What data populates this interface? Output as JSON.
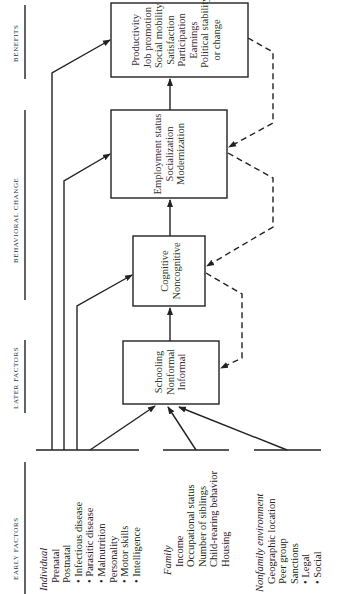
{
  "orientation": "rotated-90-ccw",
  "columns": {
    "early": "EARLY FACTORS",
    "later": "LATER FACTORS",
    "behavioral": "BEHAVIORAL CHANGE",
    "benefits": "BENEFITS"
  },
  "boxes": {
    "schooling": [
      "Schooling",
      "Nonformal",
      "Informal"
    ],
    "cognitive": [
      "Cognitive",
      "Noncognitive"
    ],
    "employment": [
      "Employment status",
      "Socialization",
      "Modernization"
    ],
    "benefits": [
      "Productivity",
      "Job promotion",
      "Social mobility",
      "Satisfaction",
      "Participation",
      "Earnings",
      "Political stability",
      "or change"
    ]
  },
  "early_factors": {
    "individual": {
      "title": "Individual",
      "items": [
        "Prenatal",
        "Postnatal",
        "• Infectious disease",
        "• Parasitic disease",
        "• Malnutrition",
        "Personality",
        "• Motor skills",
        "• Intelligence"
      ]
    },
    "family": {
      "title": "Family",
      "items": [
        "Income",
        "Occupational status",
        "Number of siblings",
        "Child-rearing behavior",
        "Housing"
      ]
    },
    "nonfamily": {
      "title": "Nonfamily environment",
      "items": [
        "Geographic location",
        "Peer group",
        "Sanctions",
        "• Legal",
        "• Social"
      ]
    }
  },
  "colors": {
    "line": "#222222",
    "text": "#333333",
    "background": "#ffffff"
  }
}
